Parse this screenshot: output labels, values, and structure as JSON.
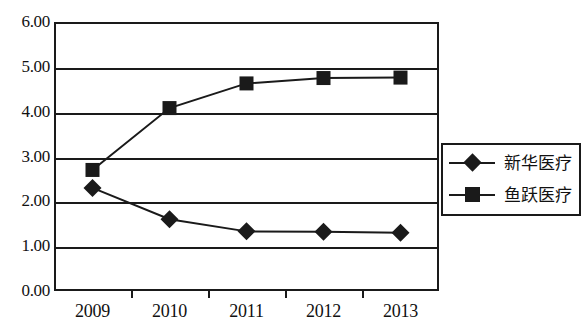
{
  "chart_data": {
    "type": "line",
    "title": "",
    "xlabel": "",
    "ylabel": "",
    "categories": [
      "2009",
      "2010",
      "2011",
      "2012",
      "2013"
    ],
    "ylim": [
      0.0,
      6.0
    ],
    "yticks": [
      "0.00",
      "1.00",
      "2.00",
      "3.00",
      "4.00",
      "5.00",
      "6.00"
    ],
    "ytick_values": [
      0,
      1,
      2,
      3,
      4,
      5,
      6
    ],
    "grid": true,
    "legend_position": "right",
    "series": [
      {
        "name": "新华医疗",
        "marker": "diamond",
        "color": "#1a1a1a",
        "values": [
          2.3,
          1.6,
          1.33,
          1.32,
          1.3
        ]
      },
      {
        "name": "鱼跃医疗",
        "marker": "square",
        "color": "#1a1a1a",
        "values": [
          2.7,
          4.08,
          4.63,
          4.75,
          4.76
        ]
      }
    ]
  },
  "legend": {
    "entries": [
      {
        "label": "新华医疗",
        "marker": "diamond"
      },
      {
        "label": "鱼跃医疗",
        "marker": "square"
      }
    ]
  }
}
